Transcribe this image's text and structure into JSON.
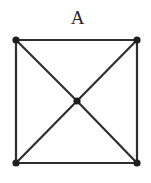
{
  "diagram": {
    "title": "A",
    "type": "graph",
    "colors": {
      "edge": "#2f2f2f",
      "node": "#1e1e1e",
      "label": "#2a2a2a",
      "background": "#ffffff"
    },
    "label_position": {
      "x": 77.5,
      "y": 24
    },
    "nodes": [
      {
        "id": "top-left",
        "x": 16,
        "y": 40
      },
      {
        "id": "top-right",
        "x": 137,
        "y": 40
      },
      {
        "id": "bottom-left",
        "x": 16,
        "y": 163
      },
      {
        "id": "bottom-right",
        "x": 137,
        "y": 163
      },
      {
        "id": "center",
        "x": 77,
        "y": 101
      }
    ],
    "edges": [
      {
        "from": "top-left",
        "to": "top-right"
      },
      {
        "from": "top-right",
        "to": "bottom-right"
      },
      {
        "from": "bottom-right",
        "to": "bottom-left"
      },
      {
        "from": "bottom-left",
        "to": "top-left"
      },
      {
        "from": "top-left",
        "to": "center"
      },
      {
        "from": "center",
        "to": "bottom-right"
      },
      {
        "from": "top-right",
        "to": "center"
      },
      {
        "from": "center",
        "to": "bottom-left"
      }
    ],
    "node_radius": 3.6
  }
}
